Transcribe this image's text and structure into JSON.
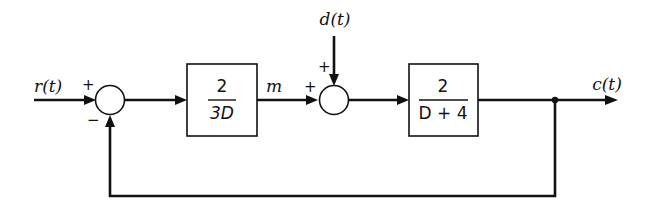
{
  "diagram": {
    "type": "feedback control block diagram",
    "signals": {
      "input": "r(t)",
      "disturbance": "d(t)",
      "intermediate": "m",
      "output": "c(t)"
    },
    "summing_junctions": [
      {
        "id": "sum1",
        "signs": {
          "r_input": "+",
          "feedback": "−"
        }
      },
      {
        "id": "sum2",
        "signs": {
          "m_input": "+",
          "disturbance": "+"
        }
      }
    ],
    "blocks": [
      {
        "id": "controller",
        "numerator": "2",
        "denominator": "3D"
      },
      {
        "id": "plant",
        "numerator": "2",
        "denominator": "D + 4"
      }
    ],
    "feedback": "unity negative feedback from c(t) to sum1"
  }
}
